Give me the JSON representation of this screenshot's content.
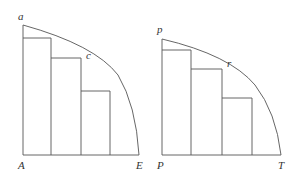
{
  "figures": [
    {
      "name": "left",
      "labels": {
        "top": "a",
        "mid": "c",
        "origin": "A",
        "end": "E"
      }
    },
    {
      "name": "right",
      "labels": {
        "top": "p",
        "mid": "r",
        "origin": "P",
        "end": "T"
      }
    }
  ]
}
